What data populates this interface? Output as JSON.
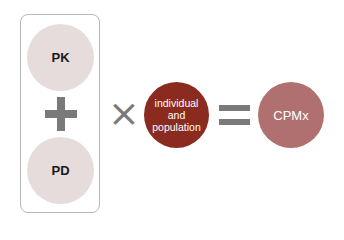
{
  "diagram": {
    "group_box": {
      "items": [
        {
          "label": "PK",
          "color": "#e6dcdc"
        },
        {
          "label": "PD",
          "color": "#e6dcdc"
        }
      ],
      "operator": "+"
    },
    "multiply_operator": "×",
    "factor": {
      "label": "individual\nand\npopulation",
      "lines": [
        "individual",
        "and",
        "population"
      ],
      "color": "#8b2a1e"
    },
    "equals_operator": "=",
    "result": {
      "label": "CPMx",
      "color": "#b07070"
    },
    "operator_color": "#7a7a7a"
  }
}
